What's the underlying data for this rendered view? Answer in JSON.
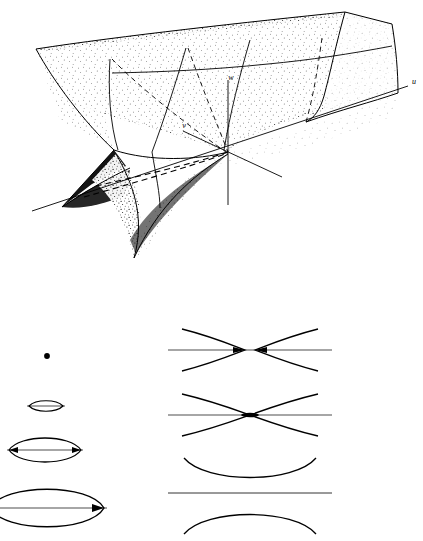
{
  "figure": {
    "caption": "",
    "background_color": "#ffffff",
    "ink_color": "#000000",
    "panels": [
      {
        "id": "surface-panel",
        "name": "swallowtail-surface",
        "description": "Stippled three-dimensional swallowtail catastrophe surface with self-intersection and two cusp edges, drawn over a u-v-w coordinate frame.",
        "bounds": {
          "x": 0,
          "y": 0,
          "width": 423,
          "height": 290
        }
      },
      {
        "id": "sections-panel",
        "name": "level-set-sections",
        "description": "Two columns of plane sections of the surface: closed lens curves on the left, hyperbolic branch curves on the right.",
        "bounds": {
          "x": 0,
          "y": 320,
          "width": 423,
          "height": 221
        }
      }
    ],
    "axes": [
      {
        "id": "u",
        "label": "u",
        "label_x": 412,
        "label_y": 84,
        "description": "long axis running to the upper right"
      },
      {
        "id": "v",
        "label": "v",
        "label_x": 186,
        "label_y": 128,
        "description": "axis running to the upper left"
      },
      {
        "id": "w",
        "label": "w",
        "label_x": 231,
        "label_y": 80,
        "description": "vertical axis"
      }
    ],
    "origin": {
      "x": 228,
      "y": 152
    },
    "sections_left": [
      {
        "index": 0,
        "name": "point",
        "shape": "point",
        "center_x": 47,
        "center_y": 356,
        "half_width": 2.6,
        "half_height": 2.6,
        "has_axis_line": false
      },
      {
        "index": 1,
        "name": "small-lens",
        "shape": "lens",
        "center_x": 46,
        "center_y": 406,
        "half_width": 17,
        "half_height": 5,
        "has_axis_line": true
      },
      {
        "index": 2,
        "name": "medium-lens",
        "shape": "lens",
        "center_x": 45,
        "center_y": 450,
        "half_width": 36,
        "half_height": 13,
        "has_axis_line": true
      },
      {
        "index": 3,
        "name": "large-lens",
        "shape": "lens",
        "center_x": 47,
        "center_y": 508,
        "half_width": 57,
        "half_height": 20,
        "has_axis_line": true
      }
    ],
    "sections_right": [
      {
        "index": 0,
        "name": "separated-branches",
        "shape": "hyperbola-pair",
        "center_x": 250,
        "center_y": 350,
        "gap": 9,
        "span": 68,
        "spread": 22,
        "has_axis_line": true
      },
      {
        "index": 1,
        "name": "touching-branches",
        "shape": "hyperbola-pair",
        "center_x": 250,
        "center_y": 415,
        "gap": 0,
        "span": 68,
        "spread": 22,
        "has_axis_line": true
      },
      {
        "index": 2,
        "name": "single-smile-arc",
        "shape": "arc-up",
        "center_x": 250,
        "center_y": 476,
        "span": 66,
        "depth": 18,
        "has_axis_line": true
      },
      {
        "index": 3,
        "name": "single-frown-arc",
        "shape": "arc-down",
        "center_x": 250,
        "center_y": 522,
        "span": 66,
        "depth": 18,
        "has_axis_line": false
      }
    ]
  }
}
